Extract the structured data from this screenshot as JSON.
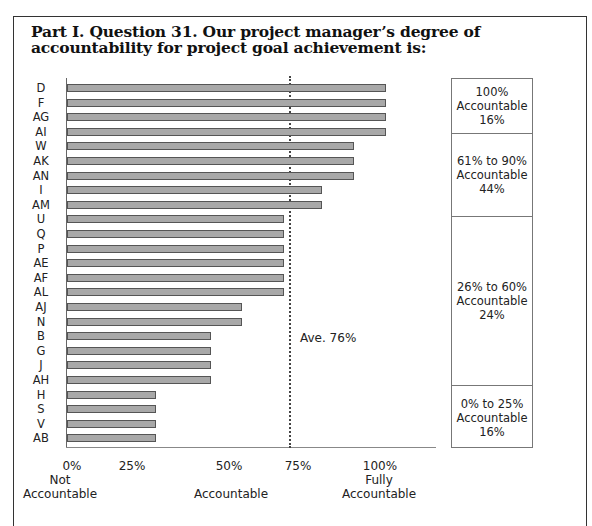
{
  "title": "Part I. Question 31. Our project manager’s degree of accountability for project goal achievement is:",
  "average_label": "Ave. 76%",
  "x_ticks": [
    "0%",
    "25%",
    "50%",
    "75%",
    "100%"
  ],
  "x_descriptors": [
    {
      "line1": "Not",
      "line2": "Accountable"
    },
    {
      "line1": "",
      "line2": "Accountable"
    },
    {
      "line1": "Fully",
      "line2": "Accountable"
    }
  ],
  "legend": [
    {
      "range": "100%",
      "label": "Accountable",
      "share": "16%"
    },
    {
      "range": "61% to 90%",
      "label": "Accountable",
      "share": "44%"
    },
    {
      "range": "26% to 60%",
      "label": "Accountable",
      "share": "24%"
    },
    {
      "range": "0% to 25%",
      "label": "Accountable",
      "share": "16%"
    }
  ],
  "chart_data": {
    "type": "bar",
    "orientation": "horizontal",
    "title": "Part I. Question 31. Our project manager’s degree of accountability for project goal achievement is:",
    "categories": [
      "D",
      "F",
      "AG",
      "AI",
      "W",
      "AK",
      "AN",
      "I",
      "AM",
      "U",
      "Q",
      "P",
      "AE",
      "AF",
      "AL",
      "AJ",
      "N",
      "B",
      "G",
      "J",
      "AH",
      "H",
      "S",
      "V",
      "AB"
    ],
    "values": [
      100,
      100,
      100,
      100,
      90,
      90,
      90,
      80,
      80,
      68,
      68,
      68,
      68,
      68,
      68,
      55,
      55,
      45,
      45,
      45,
      45,
      28,
      28,
      28,
      28
    ],
    "xlabel": "",
    "ylabel": "",
    "xlim": [
      0,
      100
    ],
    "x_tick_labels": [
      "0%",
      "25%",
      "50%",
      "75%",
      "100%"
    ],
    "x_descriptors": [
      "Not Accountable",
      "Accountable",
      "Fully Accountable"
    ],
    "reference_line": {
      "value": 72,
      "label": "Ave. 76%",
      "style": "dotted"
    },
    "annotations": [
      {
        "group": "100% Accountable",
        "share": "16%"
      },
      {
        "group": "61% to 90% Accountable",
        "share": "44%"
      },
      {
        "group": "26% to 60% Accountable",
        "share": "24%"
      },
      {
        "group": "0% to 25% Accountable",
        "share": "16%"
      }
    ],
    "grid": false,
    "legend_position": "right"
  }
}
